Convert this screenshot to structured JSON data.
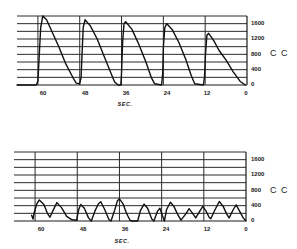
{
  "chart_data": [
    {
      "type": "line",
      "title": "",
      "xlabel": "SEC.",
      "ylabel": "CC",
      "x_ticks": [
        "60",
        "48",
        "36",
        "24",
        "12",
        "0"
      ],
      "y_ticks": [
        "1600",
        "1200",
        "800",
        "400",
        "0"
      ],
      "xlim": [
        66,
        0
      ],
      "ylim": [
        0,
        1800
      ],
      "grid": true,
      "grid_step_cc": 200,
      "y_axis_position": "right",
      "series": [
        {
          "name": "volume",
          "points": [
            [
              66,
              0
            ],
            [
              60.5,
              0
            ],
            [
              60,
              100
            ],
            [
              59.6,
              800
            ],
            [
              59.2,
              1500
            ],
            [
              58.6,
              1800
            ],
            [
              57.5,
              1700
            ],
            [
              56,
              1400
            ],
            [
              54,
              1000
            ],
            [
              52,
              550
            ],
            [
              50,
              200
            ],
            [
              49,
              50
            ],
            [
              48,
              30
            ],
            [
              47.6,
              200
            ],
            [
              47.3,
              900
            ],
            [
              47,
              1500
            ],
            [
              46.5,
              1700
            ],
            [
              45,
              1550
            ],
            [
              43,
              1200
            ],
            [
              41,
              750
            ],
            [
              39,
              300
            ],
            [
              38,
              80
            ],
            [
              37,
              0
            ],
            [
              36.2,
              0
            ],
            [
              36,
              300
            ],
            [
              35.7,
              1100
            ],
            [
              35.3,
              1600
            ],
            [
              34.8,
              1650
            ],
            [
              33,
              1450
            ],
            [
              31,
              1050
            ],
            [
              29,
              600
            ],
            [
              27.5,
              200
            ],
            [
              26.5,
              30
            ],
            [
              24.5,
              0
            ],
            [
              24.2,
              300
            ],
            [
              24,
              1000
            ],
            [
              23.6,
              1500
            ],
            [
              23,
              1600
            ],
            [
              21.5,
              1450
            ],
            [
              19.5,
              1100
            ],
            [
              17.5,
              650
            ],
            [
              16,
              250
            ],
            [
              15,
              30
            ],
            [
              12.5,
              0
            ],
            [
              12.2,
              200
            ],
            [
              11.9,
              800
            ],
            [
              11.5,
              1300
            ],
            [
              11,
              1350
            ],
            [
              9.5,
              1150
            ],
            [
              8,
              900
            ],
            [
              6,
              650
            ],
            [
              4,
              350
            ],
            [
              2,
              100
            ],
            [
              0.5,
              0
            ]
          ]
        }
      ]
    },
    {
      "type": "line",
      "title": "",
      "xlabel": "SEC.",
      "ylabel": "CC",
      "x_ticks": [
        "60",
        "48",
        "36",
        "24",
        "12",
        "0"
      ],
      "y_ticks": [
        "1600",
        "1200",
        "800",
        "400",
        "0"
      ],
      "xlim": [
        66,
        0
      ],
      "ylim": [
        0,
        1800
      ],
      "grid": true,
      "grid_step_cc": 200,
      "y_axis_position": "right",
      "series": [
        {
          "name": "volume",
          "points": [
            [
              61,
              150
            ],
            [
              60.6,
              50
            ],
            [
              60.3,
              200
            ],
            [
              59.5,
              450
            ],
            [
              58.8,
              550
            ],
            [
              57.5,
              430
            ],
            [
              56.5,
              200
            ],
            [
              55.8,
              100
            ],
            [
              54.5,
              350
            ],
            [
              53.8,
              480
            ],
            [
              52.5,
              350
            ],
            [
              51,
              120
            ],
            [
              49.5,
              30
            ],
            [
              48.2,
              20
            ],
            [
              47.6,
              300
            ],
            [
              47,
              430
            ],
            [
              46,
              330
            ],
            [
              44.8,
              80
            ],
            [
              44,
              0
            ],
            [
              43,
              250
            ],
            [
              42,
              450
            ],
            [
              41.3,
              500
            ],
            [
              40.2,
              300
            ],
            [
              39,
              40
            ],
            [
              38.4,
              0
            ],
            [
              37.3,
              300
            ],
            [
              36.6,
              520
            ],
            [
              36,
              580
            ],
            [
              35,
              450
            ],
            [
              34,
              200
            ],
            [
              33,
              20
            ],
            [
              32.5,
              0
            ],
            [
              30.8,
              0
            ],
            [
              30,
              280
            ],
            [
              29,
              440
            ],
            [
              28,
              330
            ],
            [
              26.8,
              50
            ],
            [
              26.2,
              0
            ],
            [
              25.2,
              250
            ],
            [
              24.5,
              330
            ],
            [
              23.8,
              150
            ],
            [
              23.2,
              0
            ],
            [
              22.6,
              300
            ],
            [
              21.5,
              490
            ],
            [
              20.5,
              380
            ],
            [
              19.5,
              180
            ],
            [
              18.5,
              20
            ],
            [
              17,
              200
            ],
            [
              16.2,
              320
            ],
            [
              15.2,
              200
            ],
            [
              14.3,
              80
            ],
            [
              13,
              280
            ],
            [
              12.3,
              380
            ],
            [
              11.5,
              280
            ],
            [
              10.5,
              100
            ],
            [
              10,
              60
            ],
            [
              8.8,
              300
            ],
            [
              7.6,
              510
            ],
            [
              6.5,
              380
            ],
            [
              5.5,
              180
            ],
            [
              4.8,
              80
            ],
            [
              3.6,
              300
            ],
            [
              2.8,
              420
            ],
            [
              1.8,
              250
            ],
            [
              0.8,
              80
            ],
            [
              0,
              0
            ]
          ]
        }
      ]
    }
  ],
  "top_chart": {
    "x_ticks": [
      "60",
      "48",
      "36",
      "24",
      "12",
      "0"
    ],
    "y_ticks": [
      "1600",
      "1200",
      "800",
      "400",
      "0"
    ],
    "unit": "C C",
    "xlabel": "SEC."
  },
  "bottom_chart": {
    "x_ticks": [
      "60",
      "48",
      "36",
      "24",
      "12",
      "0"
    ],
    "y_ticks": [
      "1600",
      "1200",
      "800",
      "400",
      "0"
    ],
    "unit": "C C",
    "xlabel": "SEC."
  }
}
